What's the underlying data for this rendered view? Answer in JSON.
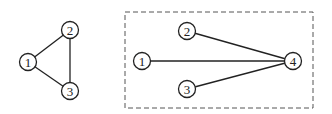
{
  "graphs": [
    {
      "name": "left-graph",
      "nodes": [
        {
          "id": "1",
          "label": "1",
          "x": 28,
          "y": 62
        },
        {
          "id": "2",
          "label": "2",
          "x": 70,
          "y": 30
        },
        {
          "id": "3",
          "label": "3",
          "x": 70,
          "y": 91
        }
      ],
      "edges": [
        [
          "1",
          "2"
        ],
        [
          "2",
          "3"
        ],
        [
          "1",
          "3"
        ]
      ]
    },
    {
      "name": "right-graph",
      "boxed": true,
      "box": {
        "x": 125,
        "y": 12,
        "w": 188,
        "h": 96
      },
      "nodes": [
        {
          "id": "1",
          "label": "1",
          "x": 142,
          "y": 61
        },
        {
          "id": "2",
          "label": "2",
          "x": 187,
          "y": 31
        },
        {
          "id": "3",
          "label": "3",
          "x": 187,
          "y": 89
        },
        {
          "id": "4",
          "label": "4",
          "x": 293,
          "y": 61
        }
      ],
      "edges": [
        [
          "1",
          "4"
        ],
        [
          "2",
          "4"
        ],
        [
          "3",
          "4"
        ]
      ]
    }
  ],
  "node_radius": 8.5
}
